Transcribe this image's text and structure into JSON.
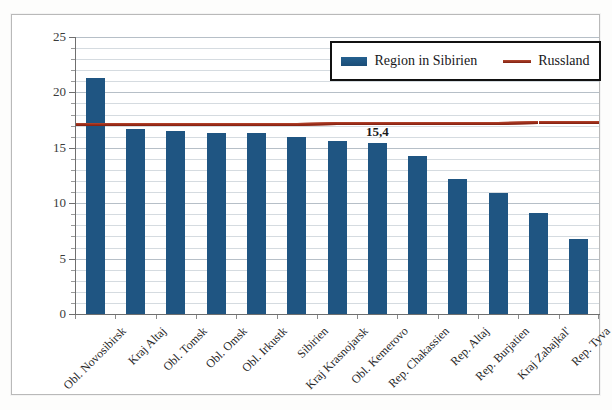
{
  "chart_data": {
    "type": "bar",
    "title": "",
    "xlabel": "",
    "ylabel": "",
    "ylim": [
      0,
      25
    ],
    "ytick_values": [
      0,
      5,
      10,
      15,
      20,
      25
    ],
    "ytick_labels": [
      "0",
      "5",
      "10",
      "15",
      "20",
      "25"
    ],
    "minor_tick_step": 1,
    "grid": true,
    "grid_orientation": "horizontal",
    "legend_position": "top-right",
    "categories": [
      "Obl. Novosibirsk",
      "Kraj Altaj",
      "Obl. Tomsk",
      "Obl. Omsk",
      "Obl. Irkustk",
      "Sibirien",
      "Kraj Krasnojarsk",
      "Obl. Kemerovo",
      "Rep. Chakassien",
      "Rep. Altaj",
      "Rep. Burjatien",
      "Kraj Zabajkal'",
      "Rep. Tyva"
    ],
    "series": [
      {
        "name": "Region in Sibirien",
        "kind": "bar",
        "color": "#1f5582",
        "values": [
          21.3,
          16.7,
          16.5,
          16.3,
          16.3,
          16.0,
          15.6,
          15.4,
          14.3,
          12.2,
          10.9,
          9.1,
          6.8
        ]
      },
      {
        "name": "Russland",
        "kind": "line",
        "color": "#9b2b18",
        "value": 17.3,
        "values": [
          17.2,
          17.2,
          17.2,
          17.2,
          17.2,
          17.2,
          17.3,
          17.3,
          17.3,
          17.3,
          17.3,
          17.4,
          17.4
        ]
      }
    ],
    "annotations": [
      {
        "text": "15,4",
        "category": "Obl. Kemerovo",
        "value": 15.4
      }
    ]
  },
  "legend": {
    "items": [
      {
        "label": "Region in Sibirien",
        "marker": "bar-swatch",
        "color": "#1f5582"
      },
      {
        "label": "Russland",
        "marker": "line-swatch",
        "color": "#9b2b18"
      }
    ]
  },
  "colors": {
    "bar": "#1f5582",
    "line": "#9b2b18",
    "grid": "#d5dbe0",
    "axis": "#6f6f6f",
    "frame": "#b9b9b9",
    "background": "#ffffff"
  }
}
